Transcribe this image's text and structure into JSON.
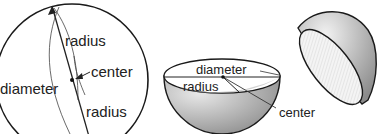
{
  "figure": {
    "panels": [
      {
        "id": "sphere",
        "labels": {
          "radius_top": "radius",
          "center": "center",
          "diameter": "diameter",
          "radius_bottom": "radius"
        }
      },
      {
        "id": "hemisphere-bowl",
        "labels": {
          "diameter": "diameter",
          "radius": "radius",
          "center": "center"
        }
      },
      {
        "id": "hemisphere-cap",
        "labels": {}
      }
    ],
    "colors": {
      "outline": "#1a1a1a",
      "shade_light": "#e6e6e6",
      "shade_dark": "#9a9a9a",
      "hatch": "#d8d8d8"
    }
  }
}
